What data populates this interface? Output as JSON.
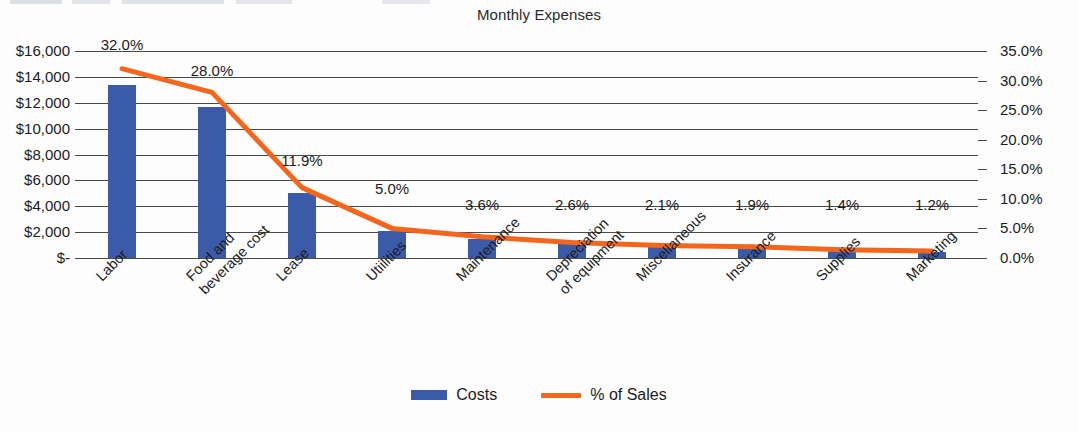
{
  "chart_data": {
    "type": "bar",
    "title": "Monthly Expenses",
    "xlabel": "",
    "ylabel": "",
    "grid": true,
    "legend_position": "bottom",
    "categories": [
      "Labor",
      "Food and beverage cost",
      "Lease",
      "Utiilities",
      "Maintenance",
      "Depreciation of equipment",
      "Miscellaneous",
      "Insurance",
      "Supplies",
      "Marketing"
    ],
    "series": [
      {
        "name": "Costs",
        "type": "bar",
        "axis": "left",
        "color": "#3b5aa8",
        "values": [
          13400,
          11700,
          5000,
          2100,
          1500,
          1100,
          900,
          800,
          600,
          500
        ]
      },
      {
        "name": "% of Sales",
        "type": "line",
        "axis": "right",
        "color": "#f4661b",
        "values": [
          32.0,
          28.0,
          11.9,
          5.0,
          3.6,
          2.6,
          2.1,
          1.9,
          1.4,
          1.2
        ],
        "data_labels": [
          "32.0%",
          "28.0%",
          "11.9%",
          "5.0%",
          "3.6%",
          "2.6%",
          "2.1%",
          "1.9%",
          "1.4%",
          "1.2%"
        ]
      }
    ],
    "left_axis": {
      "label": "",
      "ylim": [
        0,
        16000
      ],
      "tick_values": [
        16000,
        14000,
        12000,
        10000,
        8000,
        6000,
        4000,
        2000,
        0
      ],
      "tick_labels": [
        "$16,000",
        "$14,000",
        "$12,000",
        "$10,000",
        "$8,000",
        "$6,000",
        "$4,000",
        "$2,000",
        "$-"
      ]
    },
    "right_axis": {
      "label": "",
      "ylim": [
        0,
        35
      ],
      "tick_values": [
        35,
        30,
        25,
        20,
        15,
        10,
        5,
        0
      ],
      "tick_labels": [
        "35.0%",
        "30.0%",
        "25.0%",
        "20.0%",
        "15.0%",
        "10.0%",
        "5.0%",
        "0.0%"
      ]
    }
  },
  "legend": {
    "items": [
      {
        "label": "Costs",
        "color": "#3b5aa8",
        "marker": "bar-swatch"
      },
      {
        "label": "% of Sales",
        "color": "#f4661b",
        "marker": "line-swatch"
      }
    ]
  }
}
